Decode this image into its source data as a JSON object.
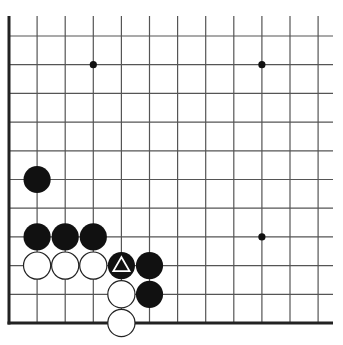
{
  "diagram": {
    "type": "go-board-fragment",
    "colors": {
      "background": "#ffffff",
      "line": "#555555",
      "edge": "#222222",
      "black": "#111111",
      "white": "#ffffff"
    },
    "grid": {
      "origin_x": 9,
      "origin_y": 36,
      "spacing_x": 28.1,
      "spacing_y": 28.7,
      "cols": 12,
      "rows": 11,
      "extend_right_to": 333,
      "extend_top_to": 16,
      "edges": [
        "left",
        "bottom"
      ]
    },
    "star_points": [
      {
        "col": 3,
        "row": 1
      },
      {
        "col": 9,
        "row": 1
      },
      {
        "col": 9,
        "row": 7
      }
    ],
    "stones": [
      {
        "color": "black",
        "col": 1,
        "row": 5
      },
      {
        "color": "black",
        "col": 1,
        "row": 7
      },
      {
        "color": "black",
        "col": 2,
        "row": 7
      },
      {
        "color": "black",
        "col": 3,
        "row": 7
      },
      {
        "color": "white",
        "col": 1,
        "row": 8
      },
      {
        "color": "white",
        "col": 2,
        "row": 8
      },
      {
        "color": "white",
        "col": 3,
        "row": 8
      },
      {
        "color": "black",
        "col": 4,
        "row": 8,
        "marker": "triangle"
      },
      {
        "color": "black",
        "col": 5,
        "row": 8
      },
      {
        "color": "white",
        "col": 4,
        "row": 9
      },
      {
        "color": "black",
        "col": 5,
        "row": 9
      },
      {
        "color": "white",
        "col": 4,
        "row": 10
      }
    ]
  }
}
